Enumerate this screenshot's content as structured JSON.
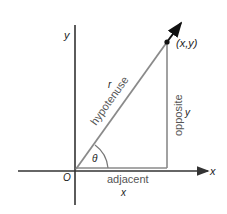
{
  "diagram": {
    "axes": {
      "x_label": "x",
      "y_label": "y",
      "origin_label": "O"
    },
    "triangle": {
      "hypotenuse_label": "hypotenuse",
      "hypotenuse_symbol": "r",
      "opposite_label": "opposite",
      "opposite_symbol": "y",
      "adjacent_label": "adjacent",
      "adjacent_symbol": "x",
      "angle_symbol": "θ",
      "point_label": "(x,y)"
    },
    "colors": {
      "axis": "#333333",
      "triangle": "#8a8a8a",
      "ray": "#111111",
      "text": "#222222",
      "side_label": "#555555"
    }
  }
}
